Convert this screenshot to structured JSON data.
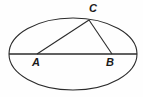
{
  "figure": {
    "type": "geometry-diagram",
    "background_color": "#fefefe",
    "stroke_color": "#2b2b2b",
    "label_color": "#1a1a1a",
    "canvas": {
      "width": 143,
      "height": 97
    }
  },
  "ellipse": {
    "center_x": 73,
    "center_y": 54,
    "radius_x": 64,
    "radius_y": 36,
    "stroke_width": 1.1
  },
  "chord": {
    "name": "major-axis-chord",
    "x1": 9,
    "y1": 54,
    "x2": 137,
    "y2": 54,
    "stroke_width": 1.3
  },
  "points": {
    "A": {
      "label": "A",
      "x": 37,
      "y": 54
    },
    "B": {
      "label": "B",
      "x": 112,
      "y": 54
    },
    "C": {
      "label": "C",
      "x": 89,
      "y": 20
    }
  },
  "segments": [
    {
      "name": "segment-AC",
      "from": "A",
      "to": "C",
      "x1": 37,
      "y1": 54,
      "x2": 89,
      "y2": 20
    },
    {
      "name": "segment-BC",
      "from": "B",
      "to": "C",
      "x1": 112,
      "y1": 54,
      "x2": 89,
      "y2": 20
    },
    {
      "name": "segment-AB",
      "from": "A",
      "to": "B",
      "x1": 37,
      "y1": 54,
      "x2": 112,
      "y2": 54
    }
  ],
  "labels": {
    "a": "A",
    "b": "B",
    "c": "C"
  }
}
